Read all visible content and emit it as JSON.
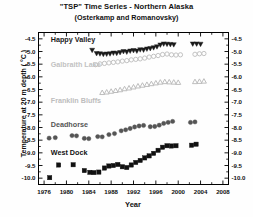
{
  "chart_data": {
    "type": "scatter",
    "title": "\"TSP\" Time Series - Northern Alaska",
    "subtitle": "(Osterkamp and Romanovsky)",
    "xlabel": "Year",
    "ylabel": "Temperature at 20 m depth ( °C )",
    "xlim": [
      1975,
      2009
    ],
    "ylim": [
      -10.25,
      -4.25
    ],
    "xticks": [
      1976,
      1980,
      1984,
      1988,
      1992,
      1996,
      2000,
      2004,
      2008
    ],
    "xtick_labels": [
      "1976",
      "1980",
      "1984",
      "1988",
      "1992",
      "1996",
      "2000",
      "2004",
      "2008"
    ],
    "yticks": [
      -4.5,
      -5.0,
      -5.5,
      -6.0,
      -6.5,
      -7.0,
      -7.5,
      -8.0,
      -8.5,
      -9.0,
      -9.5,
      -10.0
    ],
    "ytick_labels": [
      "-4.5",
      "-5.0",
      "-5.5",
      "-6.0",
      "-6.5",
      "-7.0",
      "-7.5",
      "-8.0",
      "-8.5",
      "-9.0",
      "-9.5",
      "-10.0"
    ],
    "right_axis_mirrored": true,
    "grid": false,
    "legend_position": "inline-annotations",
    "series": [
      {
        "name": "Happy Valley",
        "marker": "triangle-down",
        "filled": true,
        "color": "#1a1a1a",
        "label_x": 1977.2,
        "label_y": -4.62,
        "points": [
          [
            1984.6,
            -4.95
          ],
          [
            1985.4,
            -5.08
          ],
          [
            1986.0,
            -5.09
          ],
          [
            1986.6,
            -5.11
          ],
          [
            1987.2,
            -5.1
          ],
          [
            1987.8,
            -5.09
          ],
          [
            1988.4,
            -5.06
          ],
          [
            1989.0,
            -5.07
          ],
          [
            1989.6,
            -5.04
          ],
          [
            1990.2,
            -5.0
          ],
          [
            1990.8,
            -5.02
          ],
          [
            1991.4,
            -4.98
          ],
          [
            1992.0,
            -4.96
          ],
          [
            1992.6,
            -4.98
          ],
          [
            1993.2,
            -4.93
          ],
          [
            1993.8,
            -4.94
          ],
          [
            1994.4,
            -4.9
          ],
          [
            1995.0,
            -4.88
          ],
          [
            1995.6,
            -4.85
          ],
          [
            1996.2,
            -4.81
          ],
          [
            1996.8,
            -4.74
          ],
          [
            1997.4,
            -4.7
          ],
          [
            1998.0,
            -4.71
          ],
          [
            1998.6,
            -4.72
          ],
          [
            1999.2,
            -4.73
          ],
          [
            2002.6,
            -4.7
          ],
          [
            2003.3,
            -4.7
          ],
          [
            2004.0,
            -4.71
          ]
        ]
      },
      {
        "name": "Galbraith Lake",
        "marker": "circle",
        "filled": false,
        "color": "#c2c2c2",
        "label_x": 1977.2,
        "label_y": -5.62,
        "points": [
          [
            1985.2,
            -5.52
          ],
          [
            1986.0,
            -5.49
          ],
          [
            1986.8,
            -5.47
          ],
          [
            1987.6,
            -5.45
          ],
          [
            1988.4,
            -5.43
          ],
          [
            1989.2,
            -5.41
          ],
          [
            1990.0,
            -5.38
          ],
          [
            1990.8,
            -5.36
          ],
          [
            1991.6,
            -5.33
          ],
          [
            1992.4,
            -5.31
          ],
          [
            1993.2,
            -5.29
          ],
          [
            1994.0,
            -5.26
          ],
          [
            1994.8,
            -5.22
          ],
          [
            1995.6,
            -5.19
          ],
          [
            1996.4,
            -5.16
          ],
          [
            1997.2,
            -5.12
          ],
          [
            1998.0,
            -5.1
          ],
          [
            1998.8,
            -5.13
          ],
          [
            1999.6,
            -5.14
          ],
          [
            2000.4,
            -5.13
          ],
          [
            2003.0,
            -5.11
          ],
          [
            2003.8,
            -5.09
          ],
          [
            2004.6,
            -5.08
          ]
        ]
      },
      {
        "name": "Franklin Bluffs",
        "marker": "triangle-up",
        "filled": false,
        "color": "#bdbdbd",
        "label_x": 1977.2,
        "label_y": -7.02,
        "points": [
          [
            1986.4,
            -6.62
          ],
          [
            1987.2,
            -6.6
          ],
          [
            1988.0,
            -6.57
          ],
          [
            1988.8,
            -6.54
          ],
          [
            1989.6,
            -6.51
          ],
          [
            1990.4,
            -6.47
          ],
          [
            1991.2,
            -6.44
          ],
          [
            1992.0,
            -6.4
          ],
          [
            1992.8,
            -6.36
          ],
          [
            1993.6,
            -6.33
          ],
          [
            1994.4,
            -6.3
          ],
          [
            1995.2,
            -6.27
          ],
          [
            1996.0,
            -6.24
          ],
          [
            1996.8,
            -6.21
          ],
          [
            1997.6,
            -6.19
          ],
          [
            1998.4,
            -6.2
          ],
          [
            1999.2,
            -6.21
          ],
          [
            2000.0,
            -6.22
          ],
          [
            2003.0,
            -6.19
          ],
          [
            2003.8,
            -6.18
          ],
          [
            2004.6,
            -6.17
          ]
        ]
      },
      {
        "name": "Deadhorse",
        "marker": "circle",
        "filled": true,
        "color": "#555555",
        "label_x": 1977.2,
        "label_y": -7.98,
        "points": [
          [
            1976.9,
            -8.42
          ],
          [
            1978.0,
            -8.4
          ],
          [
            1981.0,
            -8.32
          ],
          [
            1981.8,
            -8.33
          ],
          [
            1983.2,
            -8.43
          ],
          [
            1984.0,
            -8.44
          ],
          [
            1985.6,
            -8.36
          ],
          [
            1986.4,
            -8.37
          ],
          [
            1987.6,
            -8.28
          ],
          [
            1988.6,
            -8.24
          ],
          [
            1989.8,
            -8.13
          ],
          [
            1990.6,
            -8.09
          ],
          [
            1991.4,
            -8.04
          ],
          [
            1992.2,
            -7.98
          ],
          [
            1993.0,
            -7.94
          ],
          [
            1993.8,
            -7.92
          ],
          [
            1995.0,
            -7.97
          ],
          [
            1995.8,
            -7.96
          ],
          [
            1996.6,
            -7.91
          ],
          [
            1997.4,
            -7.84
          ],
          [
            1998.2,
            -7.8
          ],
          [
            1999.0,
            -7.76
          ],
          [
            2002.2,
            -7.8
          ],
          [
            2003.0,
            -7.78
          ]
        ]
      },
      {
        "name": "West Dock",
        "marker": "square",
        "filled": true,
        "color": "#111111",
        "label_x": 1977.2,
        "label_y": -9.08,
        "points": [
          [
            1977.0,
            -9.98
          ],
          [
            1978.6,
            -9.48
          ],
          [
            1981.2,
            -9.47
          ],
          [
            1983.2,
            -9.7
          ],
          [
            1984.2,
            -9.77
          ],
          [
            1984.9,
            -9.78
          ],
          [
            1985.8,
            -9.76
          ],
          [
            1986.8,
            -9.6
          ],
          [
            1987.6,
            -9.52
          ],
          [
            1988.4,
            -9.5
          ],
          [
            1989.2,
            -9.46
          ],
          [
            1990.0,
            -9.55
          ],
          [
            1990.8,
            -9.58
          ],
          [
            1991.6,
            -9.48
          ],
          [
            1992.4,
            -9.38
          ],
          [
            1993.2,
            -9.3
          ],
          [
            1994.0,
            -9.2
          ],
          [
            1994.8,
            -9.12
          ],
          [
            1995.6,
            -9.02
          ],
          [
            1996.4,
            -8.9
          ],
          [
            1997.2,
            -8.78
          ],
          [
            1998.0,
            -8.72
          ],
          [
            1998.8,
            -8.73
          ],
          [
            1999.6,
            -8.72
          ],
          [
            2002.4,
            -8.7
          ],
          [
            2003.2,
            -8.66
          ]
        ]
      }
    ]
  }
}
